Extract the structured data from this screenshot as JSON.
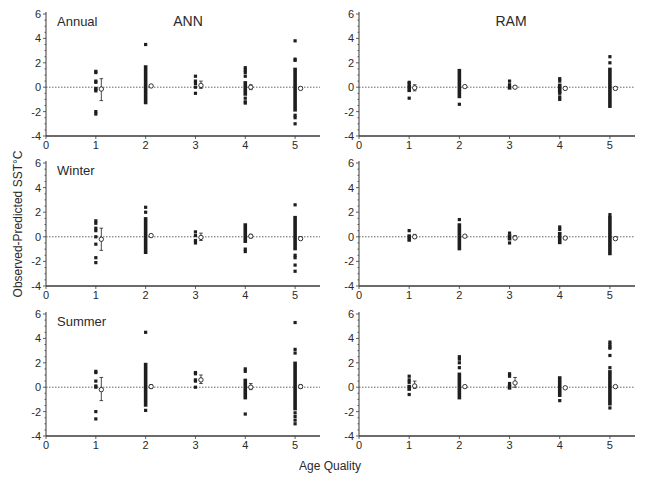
{
  "figure": {
    "ylabel": "Observed-Predicted SST°C",
    "xlabel": "Age Quality",
    "columns": [
      "ANN",
      "RAM"
    ],
    "rows": [
      "Annual",
      "Winter",
      "Summer"
    ]
  },
  "style": {
    "ink": "#1e1e1e",
    "axis": "#3a3a3a",
    "zero_line": "#555555",
    "background": "#ffffff"
  },
  "chart_data": {
    "type": "scatter",
    "title": "",
    "layout": "3x2 small multiples",
    "xlabel": "Age Quality",
    "ylabel": "Observed-Predicted SST°C",
    "xlim": [
      0,
      5.5
    ],
    "ylim": [
      -4,
      6
    ],
    "xticks": [
      0,
      1,
      2,
      3,
      4,
      5
    ],
    "yticks": [
      -4,
      -2,
      0,
      2,
      4,
      6
    ],
    "reference_line": {
      "y": 0,
      "style": "dotted"
    },
    "grid": false,
    "legend": null,
    "annotations": [
      "ANN",
      "RAM",
      "Annual",
      "Winter",
      "Summer"
    ],
    "panels": [
      {
        "row": "Annual",
        "model": "ANN",
        "row_label": "Annual",
        "col_title": "ANN",
        "groups": [
          {
            "x": 1,
            "points": [
              1.3,
              1.2,
              0.5,
              0.4,
              -0.1,
              -0.2,
              -0.3,
              -2.0,
              -2.2
            ],
            "bar": null,
            "mean": -0.15,
            "err": [
              -1.1,
              0.7
            ]
          },
          {
            "x": 2,
            "points": [
              3.5
            ],
            "bar": [
              -1.4,
              1.8
            ],
            "mean": 0.1,
            "err": [
              0.0,
              0.2
            ]
          },
          {
            "x": 3,
            "points": [
              0.9,
              0.5,
              0.3,
              0.0,
              -0.5
            ],
            "bar": null,
            "mean": 0.15,
            "err": [
              -0.1,
              0.5
            ]
          },
          {
            "x": 4,
            "points": [
              1.6,
              1.4,
              1.2,
              0.9,
              -0.9,
              -1.2,
              -1.3
            ],
            "bar": [
              -0.7,
              0.5
            ],
            "mean": 0.0,
            "err": [
              -0.2,
              0.2
            ]
          },
          {
            "x": 5,
            "points": [
              3.8,
              2.3,
              2.2,
              -2.3,
              -2.5,
              -3.0
            ],
            "bar": [
              -2.0,
              1.6
            ],
            "mean": -0.1,
            "err": [
              -0.2,
              0.0
            ]
          }
        ]
      },
      {
        "row": "Annual",
        "model": "RAM",
        "row_label": "",
        "col_title": "RAM",
        "groups": [
          {
            "x": 1,
            "points": [
              0.4,
              0.3,
              -0.9
            ],
            "bar": [
              -0.4,
              0.2
            ],
            "mean": -0.05,
            "err": [
              -0.3,
              0.2
            ]
          },
          {
            "x": 2,
            "points": [
              -1.4
            ],
            "bar": [
              -0.9,
              1.5
            ],
            "mean": 0.05,
            "err": [
              0.0,
              0.1
            ]
          },
          {
            "x": 3,
            "points": [
              0.5,
              0.2
            ],
            "bar": [
              -0.2,
              0.1
            ],
            "mean": 0.0,
            "err": [
              -0.1,
              0.1
            ]
          },
          {
            "x": 4,
            "points": [
              0.7,
              0.5,
              -0.5,
              -0.8,
              -1.0
            ],
            "bar": [
              -0.5,
              0.3
            ],
            "mean": -0.1,
            "err": [
              -0.2,
              0.0
            ]
          },
          {
            "x": 5,
            "points": [
              2.5,
              2.0
            ],
            "bar": [
              -1.7,
              1.6
            ],
            "mean": -0.1,
            "err": [
              -0.2,
              0.0
            ]
          }
        ]
      },
      {
        "row": "Winter",
        "model": "ANN",
        "row_label": "Winter",
        "col_title": "",
        "groups": [
          {
            "x": 1,
            "points": [
              1.3,
              1.1,
              0.7,
              0.5,
              0.0,
              -0.6,
              -1.7,
              -2.1
            ],
            "bar": null,
            "mean": -0.2,
            "err": [
              -1.1,
              0.7
            ]
          },
          {
            "x": 2,
            "points": [
              2.4,
              2.0
            ],
            "bar": [
              -1.4,
              1.6
            ],
            "mean": 0.1,
            "err": [
              0.0,
              0.2
            ]
          },
          {
            "x": 3,
            "points": [
              0.4,
              0.1,
              -0.3,
              -0.5
            ],
            "bar": null,
            "mean": -0.05,
            "err": [
              -0.3,
              0.3
            ]
          },
          {
            "x": 4,
            "points": [
              -1.0,
              -1.2
            ],
            "bar": [
              -0.5,
              1.1
            ],
            "mean": 0.05,
            "err": [
              -0.1,
              0.2
            ]
          },
          {
            "x": 5,
            "points": [
              2.6,
              -1.5,
              -1.7,
              -2.3,
              -2.8
            ],
            "bar": [
              -1.1,
              1.7
            ],
            "mean": -0.15,
            "err": [
              -0.2,
              0.0
            ]
          }
        ]
      },
      {
        "row": "Winter",
        "model": "RAM",
        "row_label": "",
        "col_title": "",
        "groups": [
          {
            "x": 1,
            "points": [
              0.5
            ],
            "bar": [
              -0.4,
              0.2
            ],
            "mean": 0.0,
            "err": [
              -0.1,
              0.2
            ]
          },
          {
            "x": 2,
            "points": [
              1.4
            ],
            "bar": [
              -1.1,
              1.1
            ],
            "mean": 0.05,
            "err": [
              0.0,
              0.1
            ]
          },
          {
            "x": 3,
            "points": [
              0.3,
              -0.5
            ],
            "bar": [
              -0.3,
              0.2
            ],
            "mean": -0.1,
            "err": [
              -0.2,
              0.1
            ]
          },
          {
            "x": 4,
            "points": [
              0.8,
              0.6
            ],
            "bar": [
              -0.6,
              0.4
            ],
            "mean": -0.1,
            "err": [
              -0.1,
              0.0
            ]
          },
          {
            "x": 5,
            "points": [
              1.8
            ],
            "bar": [
              -1.5,
              1.7
            ],
            "mean": -0.15,
            "err": [
              -0.2,
              0.0
            ]
          }
        ]
      },
      {
        "row": "Summer",
        "model": "ANN",
        "row_label": "Summer",
        "col_title": "",
        "groups": [
          {
            "x": 1,
            "points": [
              1.3,
              1.2,
              0.5,
              0.1,
              0.0,
              -2.0,
              -2.6
            ],
            "bar": null,
            "mean": -0.2,
            "err": [
              -1.1,
              0.8
            ]
          },
          {
            "x": 2,
            "points": [
              4.5,
              -1.9
            ],
            "bar": [
              -1.6,
              2.0
            ],
            "mean": 0.05,
            "err": [
              -0.1,
              0.2
            ]
          },
          {
            "x": 3,
            "points": [
              1.2,
              1.1,
              0.6,
              0.5,
              0.0
            ],
            "bar": null,
            "mean": 0.6,
            "err": [
              0.3,
              1.0
            ]
          },
          {
            "x": 4,
            "points": [
              1.5,
              1.3,
              -2.2
            ],
            "bar": [
              -1.0,
              0.7
            ],
            "mean": 0.0,
            "err": [
              -0.2,
              0.3
            ]
          },
          {
            "x": 5,
            "points": [
              5.3,
              3.1,
              2.8,
              -2.1,
              -2.4,
              -2.7,
              -3.0
            ],
            "bar": [
              -1.9,
              2.1
            ],
            "mean": 0.05,
            "err": [
              -0.1,
              0.2
            ]
          }
        ]
      },
      {
        "row": "Summer",
        "model": "RAM",
        "row_label": "",
        "col_title": "",
        "groups": [
          {
            "x": 1,
            "points": [
              0.9,
              0.6,
              0.4,
              -0.6
            ],
            "bar": [
              -0.3,
              0.2
            ],
            "mean": 0.1,
            "err": [
              -0.1,
              0.5
            ]
          },
          {
            "x": 2,
            "points": [
              2.5,
              2.3,
              2.0,
              1.6
            ],
            "bar": [
              -1.0,
              1.2
            ],
            "mean": 0.05,
            "err": [
              0.0,
              0.1
            ]
          },
          {
            "x": 3,
            "points": [
              1.1,
              0.9,
              0.3
            ],
            "bar": [
              -0.2,
              0.2
            ],
            "mean": 0.35,
            "err": [
              0.0,
              0.8
            ]
          },
          {
            "x": 4,
            "points": [
              -1.1
            ],
            "bar": [
              -0.8,
              0.9
            ],
            "mean": -0.05,
            "err": [
              -0.1,
              0.0
            ]
          },
          {
            "x": 5,
            "points": [
              3.7,
              3.5,
              3.3,
              3.2,
              2.6,
              1.6,
              -1.7
            ],
            "bar": [
              -1.5,
              1.4
            ],
            "mean": 0.05,
            "err": [
              0.0,
              0.1
            ]
          }
        ]
      }
    ]
  }
}
